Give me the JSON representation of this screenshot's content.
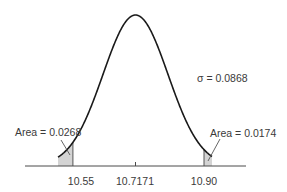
{
  "chart_data": {
    "type": "area",
    "title": "",
    "distribution": "normal",
    "mean": 10.7171,
    "sigma": 0.0868,
    "sigma_label": "σ = 0.0868",
    "xlabel": "",
    "ylabel": "",
    "grid": false,
    "x_ticks": [
      "10.55",
      "10.7171",
      "10.90"
    ],
    "x_tick_values": [
      10.55,
      10.7171,
      10.9
    ],
    "shaded_regions": [
      {
        "side": "left",
        "from": null,
        "to": 10.55,
        "area": 0.0268,
        "label": "Area = 0.0268"
      },
      {
        "side": "right",
        "from": 10.9,
        "to": null,
        "area": 0.0174,
        "label": "Area = 0.0174"
      }
    ],
    "colors": {
      "curve": "#1a1a1a",
      "shade": "#d4d4d4",
      "axis": "#4a4a4a",
      "text": "#3a3a3a"
    }
  },
  "labels": {
    "sigma": "σ = 0.0868",
    "left_area": "Area = 0.0268",
    "right_area": "Area = 0.0174",
    "tick_left": "10.55",
    "tick_mean": "10.7171",
    "tick_right": "10.90"
  }
}
